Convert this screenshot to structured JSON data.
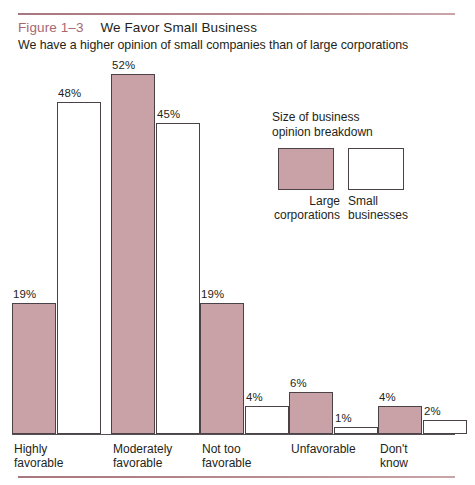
{
  "figure": {
    "number": "Figure 1–3",
    "title": "We Favor Small Business",
    "subtitle": "We have a higher opinion of small companies than of large corporations"
  },
  "legend": {
    "title_line1": "Size of business",
    "title_line2": "opinion breakdown",
    "entries": [
      {
        "label_line1": "Large",
        "label_line2": "corporations",
        "color": "#c9a2a8"
      },
      {
        "label_line1": "Small",
        "label_line2": "businesses",
        "color": "#ffffff"
      }
    ]
  },
  "colors": {
    "rule": "#a8767f",
    "figure_number": "#a8676f",
    "large_corporations": "#c9a2a8",
    "small_businesses": "#ffffff",
    "bar_outline": "#4a4247",
    "text": "#231f20"
  },
  "chart_data": {
    "type": "bar",
    "title": "We Favor Small Business",
    "subtitle": "We have a higher opinion of small companies than of large corporations",
    "xlabel": "",
    "ylabel": "",
    "ylim": [
      0,
      52
    ],
    "grid": false,
    "legend_position": "inside-upper-right",
    "categories": [
      "Highly favorable",
      "Moderately favorable",
      "Not too favorable",
      "Unfavorable",
      "Don't know"
    ],
    "category_lines": [
      [
        "Highly",
        "favorable"
      ],
      [
        "Moderately",
        "favorable"
      ],
      [
        "Not too",
        "favorable"
      ],
      [
        "Unfavorable",
        ""
      ],
      [
        "Don't",
        "know"
      ]
    ],
    "series": [
      {
        "name": "Large corporations",
        "color": "#c9a2a8",
        "values": [
          19,
          52,
          19,
          6,
          4
        ],
        "data_labels": [
          "19%",
          "52%",
          "19%",
          "6%",
          "4%"
        ]
      },
      {
        "name": "Small businesses",
        "color": "#ffffff",
        "values": [
          48,
          45,
          4,
          1,
          2
        ],
        "data_labels": [
          "48%",
          "45%",
          "4%",
          "1%",
          "2%"
        ]
      }
    ]
  }
}
